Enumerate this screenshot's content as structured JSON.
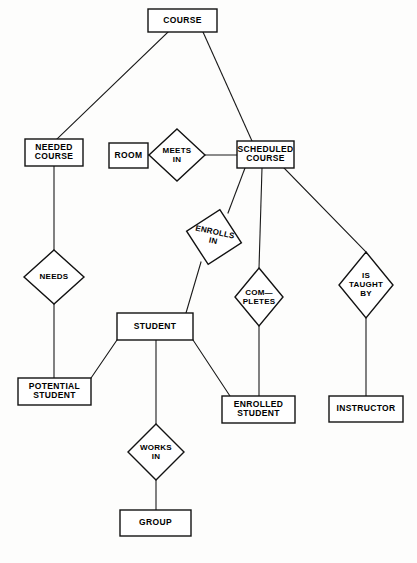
{
  "diagram": {
    "type": "entity-relationship-diagram",
    "background_color": "#fdfdfc",
    "line_color": "#121212",
    "fill_color": "#ffffff"
  },
  "entities": [
    {
      "id": "course",
      "label": "COURSE",
      "lines": [
        "COURSE"
      ],
      "x": 148,
      "y": 9,
      "w": 69,
      "h": 23
    },
    {
      "id": "needed_course",
      "label": "NEEDED COURSE",
      "lines": [
        "NEEDED",
        "COURSE"
      ],
      "x": 25,
      "y": 139,
      "w": 58,
      "h": 27
    },
    {
      "id": "room",
      "label": "ROOM",
      "lines": [
        "ROOM"
      ],
      "x": 109,
      "y": 143,
      "w": 39,
      "h": 25
    },
    {
      "id": "scheduled_course",
      "label": "SCHEDULED COURSE",
      "lines": [
        "SCHEDULED",
        "COURSE"
      ],
      "x": 237,
      "y": 141,
      "w": 57,
      "h": 27
    },
    {
      "id": "student",
      "label": "STUDENT",
      "lines": [
        "STUDENT"
      ],
      "x": 117,
      "y": 313,
      "w": 76,
      "h": 27
    },
    {
      "id": "potential_student",
      "label": "POTENTIAL STUDENT",
      "lines": [
        "POTENTIAL",
        "STUDENT"
      ],
      "x": 18,
      "y": 378,
      "w": 73,
      "h": 27
    },
    {
      "id": "enrolled_student",
      "label": "ENROLLED STUDENT",
      "lines": [
        "ENROLLED",
        "STUDENT"
      ],
      "x": 222,
      "y": 396,
      "w": 73,
      "h": 27
    },
    {
      "id": "instructor",
      "label": "INSTRUCTOR",
      "lines": [
        "INSTRUCTOR"
      ],
      "x": 329,
      "y": 396,
      "w": 74,
      "h": 26
    },
    {
      "id": "group",
      "label": "GROUP",
      "lines": [
        "GROUP"
      ],
      "x": 120,
      "y": 510,
      "w": 71,
      "h": 26
    }
  ],
  "relationships": [
    {
      "id": "meets_in",
      "label": "MEETS IN",
      "lines": [
        "MEETS",
        "IN"
      ],
      "cx": 177,
      "cy": 155,
      "rx": 28,
      "ry": 26,
      "rotation": 0
    },
    {
      "id": "needs",
      "label": "NEEDS",
      "lines": [
        "NEEDS"
      ],
      "cx": 54,
      "cy": 277,
      "rx": 30,
      "ry": 27,
      "rotation": 0
    },
    {
      "id": "enrolls_in",
      "label": "ENROLLS IN",
      "lines": [
        "ENROLLS",
        "IN"
      ],
      "cx": 214,
      "cy": 237,
      "rx": 28,
      "ry": 28,
      "rotation": 12
    },
    {
      "id": "completes",
      "label": "COM-PLETES",
      "lines": [
        "COM—",
        "PLETES"
      ],
      "cx": 259,
      "cy": 297,
      "rx": 24,
      "ry": 29,
      "rotation": 0
    },
    {
      "id": "is_taught_by",
      "label": "IS TAUGHT BY",
      "lines": [
        "IS",
        "TAUGHT",
        "BY"
      ],
      "cx": 366,
      "cy": 285,
      "rx": 27,
      "ry": 33,
      "rotation": 0
    },
    {
      "id": "works_in",
      "label": "WORKS IN",
      "lines": [
        "WORKS",
        "IN"
      ],
      "cx": 156,
      "cy": 452,
      "rx": 28,
      "ry": 28,
      "rotation": 0
    }
  ],
  "connections": [
    {
      "id": "course-needed_course",
      "from": "course",
      "to": "needed_course",
      "points": "168,32 57,139"
    },
    {
      "id": "course-scheduled_course",
      "from": "course",
      "to": "scheduled_course",
      "points": "203,32 252,141"
    },
    {
      "id": "room-meets_in",
      "from": "room",
      "to": "meets_in",
      "points": "148,155 149,155"
    },
    {
      "id": "meets_in-scheduled_course",
      "from": "meets_in",
      "to": "scheduled_course",
      "points": "205,155 237,155"
    },
    {
      "id": "needed_course-needs",
      "from": "needed_course",
      "to": "needs",
      "points": "54,166 54,250"
    },
    {
      "id": "needs-potential_student",
      "from": "needs",
      "to": "potential_student",
      "points": "54,304 54,378"
    },
    {
      "id": "scheduled_course-enrolls_in",
      "from": "scheduled_course",
      "to": "enrolls_in",
      "points": "245,168 228,213"
    },
    {
      "id": "enrolls_in-student",
      "from": "enrolls_in",
      "to": "student",
      "points": "201,262 186,313"
    },
    {
      "id": "scheduled_course-completes",
      "from": "scheduled_course",
      "to": "completes",
      "points": "262,168 259,268"
    },
    {
      "id": "completes-enrolled_student",
      "from": "completes",
      "to": "enrolled_student",
      "points": "259,326 259,396"
    },
    {
      "id": "scheduled_course-is_taught_by",
      "from": "scheduled_course",
      "to": "is_taught_by",
      "points": "284,168 366,252"
    },
    {
      "id": "is_taught_by-instructor",
      "from": "is_taught_by",
      "to": "instructor",
      "points": "366,318 366,396"
    },
    {
      "id": "student-potential_student",
      "from": "student",
      "to": "potential_student",
      "points": "117,340 91,378"
    },
    {
      "id": "student-works_in",
      "from": "student",
      "to": "works_in",
      "points": "156,340 156,424"
    },
    {
      "id": "works_in-group",
      "from": "works_in",
      "to": "group",
      "points": "156,480 156,510"
    },
    {
      "id": "student-enrolled_student",
      "from": "student",
      "to": "enrolled_student",
      "points": "193,340 230,396"
    }
  ]
}
